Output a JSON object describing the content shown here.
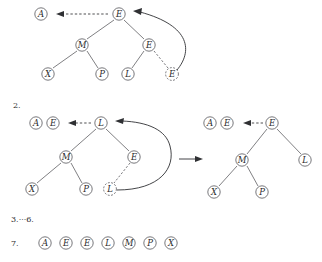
{
  "figure": {
    "colors": {
      "ink": "#2a2a2a",
      "stroke": "#55565a",
      "arrow": "#2f3033",
      "background": "#ffffff"
    },
    "steps": [
      {
        "id": "step1",
        "number_label": "",
        "trees": [
          {
            "id": "step1-tree",
            "detached": [
              {
                "id": "s1-detached-a",
                "label": "A",
                "x": 41,
                "y": 14,
                "style": "solid"
              }
            ],
            "nodes": [
              {
                "id": "s1-root-e",
                "label": "E",
                "x": 119,
                "y": 14,
                "style": "solid"
              },
              {
                "id": "s1-m",
                "label": "M",
                "x": 82,
                "y": 45,
                "style": "solid"
              },
              {
                "id": "s1-e-right",
                "label": "E",
                "x": 149,
                "y": 45,
                "style": "solid"
              },
              {
                "id": "s1-x",
                "label": "X",
                "x": 48,
                "y": 74,
                "style": "solid"
              },
              {
                "id": "s1-p",
                "label": "P",
                "x": 102,
                "y": 74,
                "style": "solid"
              },
              {
                "id": "s1-l",
                "label": "L",
                "x": 128,
                "y": 74,
                "style": "solid"
              },
              {
                "id": "s1-e-dashed",
                "label": "E",
                "x": 172,
                "y": 74,
                "style": "dashed"
              }
            ],
            "edges": [
              {
                "from": "s1-root-e",
                "to": "s1-m",
                "style": "solid"
              },
              {
                "from": "s1-root-e",
                "to": "s1-e-right",
                "style": "solid"
              },
              {
                "from": "s1-m",
                "to": "s1-x",
                "style": "solid"
              },
              {
                "from": "s1-m",
                "to": "s1-p",
                "style": "solid"
              },
              {
                "from": "s1-e-right",
                "to": "s1-l",
                "style": "solid"
              },
              {
                "from": "s1-e-right",
                "to": "s1-e-dashed",
                "style": "dashed"
              }
            ]
          }
        ],
        "annotations": [
          {
            "id": "s1-emit-arrow",
            "type": "dashed-arrow-left",
            "label": "emit to output"
          },
          {
            "id": "s1-promote-arrow",
            "type": "curved-arrow",
            "label": "promote dashed node to root"
          }
        ]
      },
      {
        "id": "step2",
        "number_label": "2.",
        "trees": [
          {
            "id": "step2-tree-left",
            "detached": [
              {
                "id": "s2l-detached-a",
                "label": "A",
                "x": 36,
                "y": 123,
                "style": "solid"
              },
              {
                "id": "s2l-detached-e",
                "label": "E",
                "x": 53,
                "y": 123,
                "style": "solid"
              }
            ],
            "nodes": [
              {
                "id": "s2l-root-l",
                "label": "L",
                "x": 101,
                "y": 123,
                "style": "solid"
              },
              {
                "id": "s2l-m",
                "label": "M",
                "x": 66,
                "y": 157,
                "style": "solid"
              },
              {
                "id": "s2l-e",
                "label": "E",
                "x": 134,
                "y": 157,
                "style": "solid"
              },
              {
                "id": "s2l-x",
                "label": "X",
                "x": 32,
                "y": 189,
                "style": "solid"
              },
              {
                "id": "s2l-p",
                "label": "P",
                "x": 86,
                "y": 189,
                "style": "solid"
              },
              {
                "id": "s2l-l-dashed",
                "label": "L",
                "x": 110,
                "y": 189,
                "style": "dashed"
              }
            ],
            "edges": [
              {
                "from": "s2l-root-l",
                "to": "s2l-m",
                "style": "solid"
              },
              {
                "from": "s2l-root-l",
                "to": "s2l-e",
                "style": "solid"
              },
              {
                "from": "s2l-m",
                "to": "s2l-x",
                "style": "solid"
              },
              {
                "from": "s2l-m",
                "to": "s2l-p",
                "style": "solid"
              },
              {
                "from": "s2l-e",
                "to": "s2l-l-dashed",
                "style": "dashed"
              }
            ]
          },
          {
            "id": "step2-tree-right",
            "detached": [
              {
                "id": "s2r-detached-a",
                "label": "A",
                "x": 210,
                "y": 123,
                "style": "solid"
              },
              {
                "id": "s2r-detached-e",
                "label": "E",
                "x": 227,
                "y": 123,
                "style": "solid"
              }
            ],
            "nodes": [
              {
                "id": "s2r-root-e",
                "label": "E",
                "x": 272,
                "y": 123,
                "style": "solid"
              },
              {
                "id": "s2r-m",
                "label": "M",
                "x": 242,
                "y": 160,
                "style": "solid"
              },
              {
                "id": "s2r-l",
                "label": "L",
                "x": 305,
                "y": 160,
                "style": "solid"
              },
              {
                "id": "s2r-x",
                "label": "X",
                "x": 214,
                "y": 192,
                "style": "solid"
              },
              {
                "id": "s2r-p",
                "label": "P",
                "x": 262,
                "y": 192,
                "style": "solid"
              }
            ],
            "edges": [
              {
                "from": "s2r-root-e",
                "to": "s2r-m",
                "style": "solid"
              },
              {
                "from": "s2r-root-e",
                "to": "s2r-l",
                "style": "solid"
              },
              {
                "from": "s2r-m",
                "to": "s2r-x",
                "style": "solid"
              },
              {
                "from": "s2r-m",
                "to": "s2r-p",
                "style": "solid"
              }
            ]
          }
        ],
        "annotations": [
          {
            "id": "s2-emit-arrow-left",
            "type": "dashed-arrow-left",
            "label": "emit to output"
          },
          {
            "id": "s2-promote-arrow",
            "type": "curved-arrow",
            "label": "promote dashed node to root"
          },
          {
            "id": "s2-transform-arrow",
            "type": "solid-arrow-right",
            "label": "result after sift-down"
          },
          {
            "id": "s2-emit-arrow-right",
            "type": "dashed-arrow-left",
            "label": "emit to output"
          }
        ]
      },
      {
        "id": "step3to6",
        "number_label": "3.···6.",
        "trees": [],
        "annotations": []
      },
      {
        "id": "step7",
        "number_label": "7.",
        "result_row": {
          "id": "final-sorted-row",
          "labels": [
            "A",
            "E",
            "E",
            "L",
            "M",
            "P",
            "X"
          ],
          "x_start": 45,
          "x_step": 21,
          "y": 243
        },
        "trees": [],
        "annotations": []
      }
    ]
  }
}
